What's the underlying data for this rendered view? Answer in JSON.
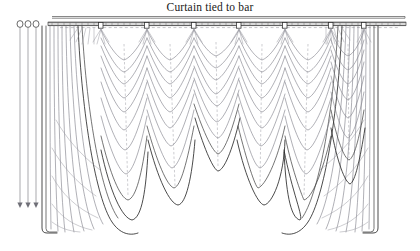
{
  "figure": {
    "title": "Curtain tied to bar",
    "background_color": "#ffffff",
    "ink_color": "#2b2b2b",
    "fold_color": "#7b7b84",
    "rod_color": "#555555",
    "width": 420,
    "height": 251
  },
  "rod": {
    "name": "curtain-bar",
    "x_start": 48,
    "x_end": 406,
    "y": 24,
    "thickness": 3,
    "tick_count": 58,
    "top_rail_y": 17,
    "top_rail_x_start": 52,
    "top_rail_x_end": 405
  },
  "rings": {
    "name": "curtain-rings",
    "count": 3,
    "positions_x": [
      20,
      28,
      36
    ],
    "y": 24,
    "radius": 3.2
  },
  "cords": {
    "name": "pull-cords",
    "count": 3,
    "positions_x": [
      20,
      28,
      36
    ],
    "y_start": 28,
    "y_end": 207,
    "arrow_size": 3.5
  },
  "tie_points": {
    "name": "swag-tie-points",
    "label": "tie clip",
    "count": 7,
    "positions_x": [
      101,
      147,
      194,
      239,
      285,
      331,
      364
    ],
    "y": 26
  },
  "swags": {
    "name": "swag-festoons",
    "count": 6,
    "drape_rows": 9,
    "description": "scalloped fabric festoons hanging between tie points"
  },
  "panels": {
    "left": {
      "name": "left-side-panel",
      "top_x": 42,
      "bottom_x": 48,
      "hem_y": 233,
      "pleat_count": 7
    },
    "right": {
      "name": "right-side-panel",
      "top_x": 378,
      "bottom_x": 372,
      "hem_y": 233,
      "pleat_count": 7
    }
  },
  "legend": {
    "visible": false
  }
}
